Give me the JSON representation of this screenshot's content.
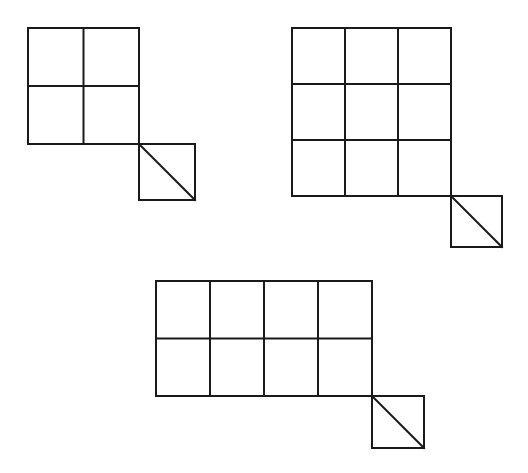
{
  "diagram": {
    "colors": {
      "line": "#1a1a1a",
      "background": "#ffffff"
    },
    "figures": [
      {
        "id": "figure-2x2",
        "columns": 2,
        "rows": 2,
        "corner_square": true,
        "corner_diagonal": "top-left-to-bottom-right"
      },
      {
        "id": "figure-3x3",
        "columns": 3,
        "rows": 3,
        "corner_square": true,
        "corner_diagonal": "top-left-to-bottom-right"
      },
      {
        "id": "figure-4x2",
        "columns": 4,
        "rows": 2,
        "corner_square": true,
        "corner_diagonal": "top-left-to-bottom-right"
      }
    ]
  }
}
